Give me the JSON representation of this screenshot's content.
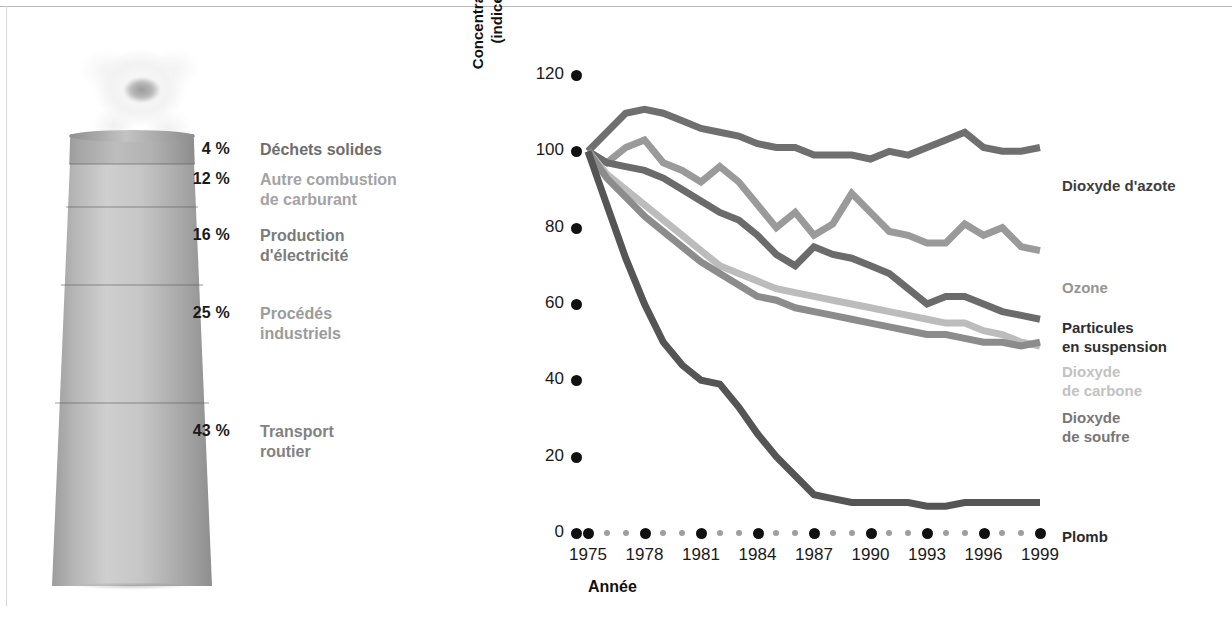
{
  "sources": {
    "items": [
      {
        "pct": "4 %",
        "label": "Déchets solides",
        "color": "#6e6e6e",
        "top": 0,
        "lines": 1
      },
      {
        "pct": "12 %",
        "label": "Autre combustion\nde carburant",
        "color": "#a3a3a3",
        "top": 30,
        "lines": 2
      },
      {
        "pct": "16 %",
        "label": "Production\nd'électricité",
        "color": "#7b7b7b",
        "top": 86,
        "lines": 2
      },
      {
        "pct": "25 %",
        "label": "Procédés\nindustriels",
        "color": "#9b9b9b",
        "top": 164,
        "lines": 2
      },
      {
        "pct": "43 %",
        "label": "Transport\nroutier",
        "color": "#828282",
        "top": 282,
        "lines": 2
      }
    ]
  },
  "chart_data": {
    "type": "line",
    "title": "",
    "xlabel": "Année",
    "ylabel": "Concentrations ambiantes\n(indice, 1975 = 100)",
    "ylim": [
      0,
      120
    ],
    "yticks": [
      0,
      20,
      40,
      60,
      80,
      100,
      120
    ],
    "xlim": [
      1975,
      1999
    ],
    "x": [
      1975,
      1976,
      1977,
      1978,
      1979,
      1980,
      1981,
      1982,
      1983,
      1984,
      1985,
      1986,
      1987,
      1988,
      1989,
      1990,
      1991,
      1992,
      1993,
      1994,
      1995,
      1996,
      1997,
      1998,
      1999
    ],
    "xticks": [
      1975,
      1978,
      1981,
      1984,
      1987,
      1990,
      1993,
      1996,
      1999
    ],
    "xticklabels": [
      "1975",
      "1978",
      "1981",
      "1984",
      "1987",
      "1990",
      "1993",
      "1996",
      "1999"
    ],
    "grid": false,
    "legend_position": "right-of-plot",
    "series": [
      {
        "name": "Dioxyde d'azote",
        "color": "#6f6f6f",
        "label_color": "#3d3d3d",
        "label_top": 136,
        "values": [
          100,
          105,
          110,
          111,
          110,
          108,
          106,
          105,
          104,
          102,
          101,
          101,
          99,
          99,
          99,
          98,
          100,
          99,
          101,
          103,
          105,
          101,
          100,
          100,
          101
        ]
      },
      {
        "name": "Ozone",
        "color": "#9a9a9a",
        "label_color": "#949494",
        "label_top": 238,
        "values": [
          100,
          97,
          101,
          103,
          97,
          95,
          92,
          96,
          92,
          86,
          80,
          84,
          78,
          81,
          89,
          84,
          79,
          78,
          76,
          76,
          81,
          78,
          80,
          75,
          74
        ]
      },
      {
        "name": "Particules\nen suspension",
        "color": "#6b6b6b",
        "label_color": "#2f2f2f",
        "label_top": 278,
        "values": [
          100,
          97,
          96,
          95,
          93,
          90,
          87,
          84,
          82,
          78,
          73,
          70,
          75,
          73,
          72,
          70,
          68,
          64,
          60,
          62,
          62,
          60,
          58,
          57,
          56
        ]
      },
      {
        "name": "Dioxyde\nde carbone",
        "color": "#bcbcbc",
        "label_color": "#c2c2c2",
        "label_top": 322,
        "values": [
          100,
          94,
          90,
          86,
          82,
          78,
          74,
          70,
          68,
          66,
          64,
          63,
          62,
          61,
          60,
          59,
          58,
          57,
          56,
          55,
          55,
          53,
          52,
          50,
          49
        ]
      },
      {
        "name": "Dioxyde\nde soufre",
        "color": "#8c8c8c",
        "label_color": "#777777",
        "label_top": 368,
        "values": [
          100,
          93,
          88,
          83,
          79,
          75,
          71,
          68,
          65,
          62,
          61,
          59,
          58,
          57,
          56,
          55,
          54,
          53,
          52,
          52,
          51,
          50,
          50,
          49,
          50
        ]
      },
      {
        "name": "Plomb",
        "color": "#555555",
        "label_color": "#2b2b2b",
        "label_top": 487,
        "values": [
          100,
          86,
          72,
          60,
          50,
          44,
          40,
          39,
          33,
          26,
          20,
          15,
          10,
          9,
          8,
          8,
          8,
          8,
          7,
          7,
          8,
          8,
          8,
          8,
          8
        ]
      }
    ]
  }
}
